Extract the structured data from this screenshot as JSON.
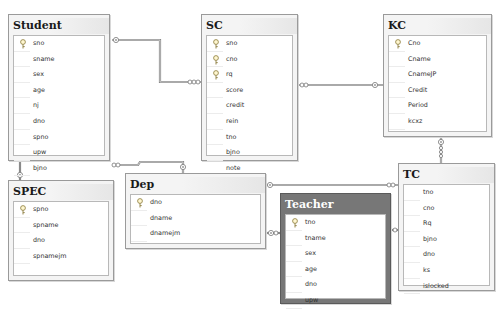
{
  "diagram": {
    "type": "database-relationship-diagram",
    "colors": {
      "table_bg": "#f4f4f4",
      "table_border": "#9a9a9a",
      "selected_table_bg": "#777777",
      "connector": "#8a8a8a"
    },
    "tables": {
      "student": {
        "title": "Student",
        "columns": [
          {
            "name": "sno",
            "pk": true
          },
          {
            "name": "sname",
            "pk": false
          },
          {
            "name": "sex",
            "pk": false
          },
          {
            "name": "age",
            "pk": false
          },
          {
            "name": "nj",
            "pk": false
          },
          {
            "name": "dno",
            "pk": false
          },
          {
            "name": "spno",
            "pk": false
          },
          {
            "name": "upw",
            "pk": false
          },
          {
            "name": "bjno",
            "pk": false
          }
        ]
      },
      "sc": {
        "title": "SC",
        "columns": [
          {
            "name": "sno",
            "pk": true
          },
          {
            "name": "cno",
            "pk": true
          },
          {
            "name": "rq",
            "pk": true
          },
          {
            "name": "score",
            "pk": false
          },
          {
            "name": "credit",
            "pk": false
          },
          {
            "name": "rein",
            "pk": false
          },
          {
            "name": "tno",
            "pk": false
          },
          {
            "name": "bjno",
            "pk": false
          },
          {
            "name": "note",
            "pk": false
          }
        ]
      },
      "kc": {
        "title": "KC",
        "columns": [
          {
            "name": "Cno",
            "pk": true
          },
          {
            "name": "Cname",
            "pk": false
          },
          {
            "name": "CnameJP",
            "pk": false
          },
          {
            "name": "Credit",
            "pk": false
          },
          {
            "name": "Period",
            "pk": false
          },
          {
            "name": "kcxz",
            "pk": false
          }
        ]
      },
      "spec": {
        "title": "SPEC",
        "columns": [
          {
            "name": "spno",
            "pk": true
          },
          {
            "name": "spname",
            "pk": false
          },
          {
            "name": "dno",
            "pk": false
          },
          {
            "name": "spnamejm",
            "pk": false
          }
        ]
      },
      "dep": {
        "title": "Dep",
        "columns": [
          {
            "name": "dno",
            "pk": true
          },
          {
            "name": "dname",
            "pk": false
          },
          {
            "name": "dnamejm",
            "pk": false
          }
        ]
      },
      "teacher": {
        "title": "Teacher",
        "selected": true,
        "columns": [
          {
            "name": "tno",
            "pk": true
          },
          {
            "name": "tname",
            "pk": false
          },
          {
            "name": "sex",
            "pk": false
          },
          {
            "name": "age",
            "pk": false
          },
          {
            "name": "dno",
            "pk": false
          },
          {
            "name": "upw",
            "pk": false
          }
        ]
      },
      "tc": {
        "title": "TC",
        "columns": [
          {
            "name": "tno",
            "pk": false
          },
          {
            "name": "cno",
            "pk": false
          },
          {
            "name": "Rq",
            "pk": false
          },
          {
            "name": "bjno",
            "pk": false
          },
          {
            "name": "dno",
            "pk": false
          },
          {
            "name": "ks",
            "pk": false
          },
          {
            "name": "islocked",
            "pk": false
          }
        ]
      }
    },
    "relationships": [
      {
        "from": "Student",
        "to": "SC",
        "one": "Student",
        "many": "SC"
      },
      {
        "from": "SC",
        "to": "KC",
        "one": "KC",
        "many": "SC"
      },
      {
        "from": "KC",
        "to": "TC",
        "one": "KC",
        "many": "TC"
      },
      {
        "from": "Student",
        "to": "SPEC",
        "one": "SPEC",
        "many": "Student"
      },
      {
        "from": "Student",
        "to": "Dep",
        "one": "Dep",
        "many": "Student"
      },
      {
        "from": "Dep",
        "to": "TC",
        "one": "Dep",
        "many": "TC"
      },
      {
        "from": "Dep",
        "to": "Teacher",
        "one": "Dep",
        "many": "Teacher"
      },
      {
        "from": "Teacher",
        "to": "TC",
        "one": "Teacher",
        "many": "TC"
      }
    ]
  }
}
